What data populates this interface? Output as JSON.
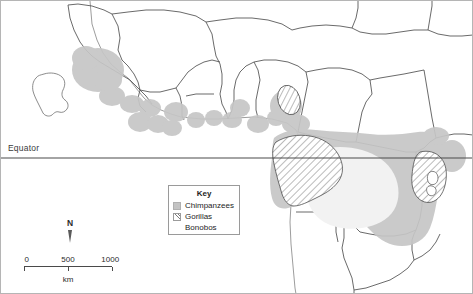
{
  "map": {
    "title": "Great ape distribution in Africa",
    "equator_label": "Equator",
    "colors": {
      "chimpanzee_fill": "#c3c3c3",
      "gorilla_hatch": "#7d7d7d",
      "bonobo_fill": "#eeeeee",
      "border": "#555555",
      "coastline": "#8a8a8a",
      "frame": "#9a9a9a"
    }
  },
  "legend": {
    "title": "Key",
    "items": [
      {
        "label": "Chimpanzees",
        "swatch": "solid",
        "icon": "legend-swatch-chimpanzees"
      },
      {
        "label": "Gorillas",
        "swatch": "hatch",
        "icon": "legend-swatch-gorillas"
      },
      {
        "label": "Bonobos",
        "swatch": "blank",
        "icon": "legend-swatch-bonobos"
      }
    ]
  },
  "north_arrow": {
    "label": "N",
    "icon": "north-arrow-icon"
  },
  "scale_bar": {
    "ticks": [
      "0",
      "500",
      "1000"
    ],
    "tick_positions": [
      0,
      50,
      100
    ],
    "unit": "km"
  }
}
